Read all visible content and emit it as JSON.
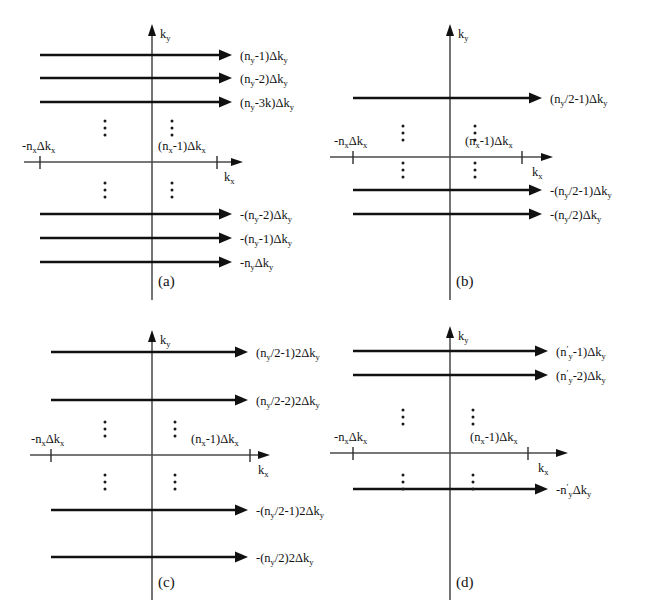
{
  "figure": {
    "background": "#ffffff",
    "line_color": "#111111",
    "axis_color": "#3a3a3a"
  },
  "axis_labels": {
    "ky": "k",
    "ky_sub": "y",
    "kx": "k",
    "kx_sub": "x",
    "x_left_tick": "-n",
    "x_left_tick_sub": "x",
    "x_left_tick_tail": "Δk",
    "x_left_tick_tail_sub": "x",
    "x_right_tick": "(n",
    "x_right_tick_sub": "x",
    "x_right_tick_tail": "-1)Δk",
    "x_right_tick_tail_sub": "x"
  },
  "panels": [
    {
      "id": "a",
      "caption": "(a)",
      "rays": [
        {
          "label_pre": "(n",
          "label_sub": "y",
          "label_post": "-1)Δk",
          "label_post_sub": "y",
          "y": 55
        },
        {
          "label_pre": "(n",
          "label_sub": "y",
          "label_post": "-2)Δk",
          "label_post_sub": "y",
          "y": 78
        },
        {
          "label_pre": "(n",
          "label_sub": "y",
          "label_post": "-3k)Δk",
          "label_post_sub": "y",
          "y": 102
        },
        {
          "label_pre": "-(n",
          "label_sub": "y",
          "label_post": "-2)Δk",
          "label_post_sub": "y",
          "y": 214
        },
        {
          "label_pre": "-(n",
          "label_sub": "y",
          "label_post": "-1)Δk",
          "label_post_sub": "y",
          "y": 238
        },
        {
          "label_pre": "-n",
          "label_sub": "y",
          "label_post": "Δk",
          "label_post_sub": "y",
          "y": 262
        }
      ],
      "ellipsis_rows": [
        128,
        190
      ]
    },
    {
      "id": "b",
      "caption": "(b)",
      "rays": [
        {
          "label_pre": "(n",
          "label_sub": "y",
          "label_post": "/2-1)Δk",
          "label_post_sub": "y",
          "y": 98
        },
        {
          "label_pre": "-(n",
          "label_sub": "y",
          "label_post": "/2-1)Δk",
          "label_post_sub": "y",
          "y": 190
        },
        {
          "label_pre": "-(n",
          "label_sub": "y",
          "label_post": "/2)Δk",
          "label_post_sub": "y",
          "y": 214
        }
      ],
      "ellipsis_rows": [
        133,
        170
      ]
    },
    {
      "id": "c",
      "caption": "(c)",
      "rays": [
        {
          "label_pre": "(n",
          "label_sub": "y",
          "label_post": "/2-1)2Δk",
          "label_post_sub": "y",
          "y": 42
        },
        {
          "label_pre": "(n",
          "label_sub": "y",
          "label_post": "/2-2)2Δk",
          "label_post_sub": "y",
          "y": 90
        },
        {
          "label_pre": "-(n",
          "label_sub": "y",
          "label_post": "/2-1)2Δk",
          "label_post_sub": "y",
          "y": 200
        },
        {
          "label_pre": "-(n",
          "label_sub": "y",
          "label_post": "/2)2Δk",
          "label_post_sub": "y",
          "y": 247
        }
      ],
      "ellipsis_rows": [
        119,
        172
      ]
    },
    {
      "id": "d",
      "caption": "(d)",
      "rays": [
        {
          "label_pre": "(n",
          "label_sub": "y",
          "label_post": "-1)Δk",
          "label_post_sub": "y",
          "primed": true,
          "y": 41
        },
        {
          "label_pre": "(n",
          "label_sub": "y",
          "label_post": "-2)Δk",
          "label_post_sub": "y",
          "primed": true,
          "y": 65
        },
        {
          "label_pre": "-n",
          "label_sub": "y",
          "label_post": "Δk",
          "label_post_sub": "y",
          "primed": true,
          "y": 179
        }
      ],
      "ellipsis_rows": [
        107,
        172
      ]
    }
  ]
}
